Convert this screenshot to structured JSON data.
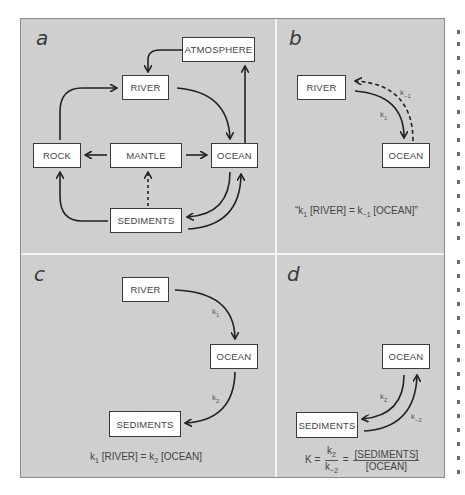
{
  "figure": {
    "background": "#cfcfcf",
    "box_fill": "#ffffff",
    "line_color": "#222222",
    "divider_color": "#f4f4f4"
  },
  "panels": {
    "a": {
      "letter": "a",
      "boxes": {
        "atmosphere": "ATMOSPHERE",
        "river": "RIVER",
        "rock": "ROCK",
        "mantle": "MANTLE",
        "ocean": "OCEAN",
        "sediments": "SEDIMENTS"
      }
    },
    "b": {
      "letter": "b",
      "boxes": {
        "river": "RIVER",
        "ocean": "OCEAN"
      },
      "rate_forward": "k",
      "rate_forward_sub": "1",
      "rate_reverse": "k",
      "rate_reverse_sub": "−1",
      "equation": {
        "open_quote": "“",
        "k1": "k",
        "k1_sub": "1",
        "left": " [RIVER] = ",
        "km1": "k",
        "km1_sub": "−1",
        "right": " [OCEAN]",
        "close_quote": "”"
      }
    },
    "c": {
      "letter": "c",
      "boxes": {
        "river": "RIVER",
        "ocean": "OCEAN",
        "sediments": "SEDIMENTS"
      },
      "rate_1": "k",
      "rate_1_sub": "1",
      "rate_2": "k",
      "rate_2_sub": "2",
      "equation": {
        "k1": "k",
        "k1_sub": "1",
        "left": " [RIVER] = ",
        "k2": "k",
        "k2_sub": "2",
        "right": " [OCEAN]"
      }
    },
    "d": {
      "letter": "d",
      "boxes": {
        "ocean": "OCEAN",
        "sediments": "SEDIMENTS"
      },
      "rate_forward": "k",
      "rate_forward_sub": "2",
      "rate_reverse": "k",
      "rate_reverse_sub": "−2",
      "equation": {
        "K": "K = ",
        "frac1_num": "k",
        "frac1_num_sub": "2",
        "frac1_den": "k",
        "frac1_den_sub": "−2",
        "eq": " = ",
        "frac2_num": "[SEDIMENTS]",
        "frac2_den": "[OCEAN]"
      }
    }
  }
}
